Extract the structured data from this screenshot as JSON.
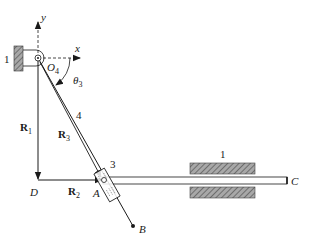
{
  "diagram": {
    "type": "inverted slider-crank mechanism",
    "colors": {
      "line": "#1a1a1a",
      "hatch_fill": "#8c8c8c",
      "background": "#ffffff"
    },
    "axes": {
      "x_label": "x",
      "y_label": "y"
    },
    "points": {
      "O4": "O",
      "O4_sub": "4",
      "A": "A",
      "B": "B",
      "C": "C",
      "D": "D"
    },
    "angle": {
      "symbol": "θ",
      "sub": "3"
    },
    "vectors": {
      "R1": {
        "main": "R",
        "sub": "1"
      },
      "R2": {
        "main": "R",
        "sub": "2"
      },
      "R3": {
        "main": "R",
        "sub": "3"
      }
    },
    "links": {
      "ground_left": "1",
      "ground_right": "1",
      "rod": "2",
      "slider": "3",
      "crank": "4"
    }
  }
}
